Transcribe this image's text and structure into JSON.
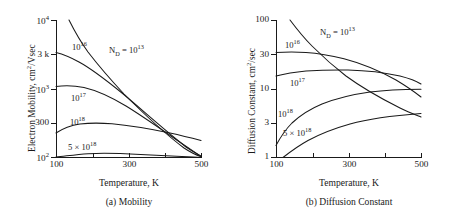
{
  "figure": {
    "background": "#ffffff",
    "line_color": "#1a1a1a"
  },
  "chart_data": [
    {
      "type": "line",
      "panel_id": "a",
      "title": "",
      "caption": "(a) Mobility",
      "xlabel": "Temperature, K",
      "ylabel": "Electron Mobility, cm2/Vsec",
      "ylabel_html": "Electron Mobility, cm<sup>2</sup>/Vsec",
      "xscale": "linear",
      "yscale": "log",
      "xlim": [
        100,
        500
      ],
      "ylim": [
        100,
        10000
      ],
      "grid": false,
      "legend_position": "inline-curve-labels",
      "xticks": [
        100,
        200,
        300,
        400,
        500
      ],
      "xtick_labels": [
        "100",
        "",
        "300",
        "",
        "500"
      ],
      "yticks": [
        100,
        300,
        1000,
        3000,
        10000
      ],
      "ytick_labels": [
        "10^2",
        "300",
        "10^3",
        "3 k",
        "10^4"
      ],
      "ytick_labels_html": [
        "10<sup>2</sup>",
        "300",
        "10<sup>3</sup>",
        "3 k",
        "10<sup>4</sup>"
      ],
      "x": [
        100,
        125,
        150,
        175,
        200,
        250,
        300,
        350,
        400,
        450,
        500
      ],
      "series": [
        {
          "name": "N_D = 10^13",
          "label": "N<sub>D</sub> = 10<sup>13</sup>",
          "values": [
            null,
            10000,
            6400,
            4600,
            3500,
            2300,
            1600,
            1150,
            820,
            580,
            320
          ]
        },
        {
          "name": "10^16",
          "label": "10<sup>16</sup>",
          "values": [
            3200,
            3050,
            2800,
            2500,
            2200,
            1700,
            1350,
            1020,
            760,
            560,
            330
          ]
        },
        {
          "name": "10^17",
          "label": "10<sup>17</sup>",
          "values": [
            1550,
            1580,
            1570,
            1530,
            1470,
            1300,
            1110,
            900,
            700,
            520,
            310
          ]
        },
        {
          "name": "10^18",
          "label": "10<sup>18</sup>",
          "values": [
            235,
            265,
            288,
            298,
            302,
            300,
            293,
            285,
            275,
            264,
            250
          ]
        },
        {
          "name": "5 x 10^18",
          "label": "5 &#215; 10<sup>18</sup>",
          "values": [
            101,
            106,
            111,
            115,
            117,
            116,
            113,
            110,
            107,
            104,
            101
          ]
        }
      ]
    },
    {
      "type": "line",
      "panel_id": "b",
      "title": "",
      "caption": "(b) Diffusion Constant",
      "xlabel": "Temperature, K",
      "ylabel": "Diffusion Constant, cm2/sec",
      "ylabel_html": "Diffusion Constant, cm<sup>2</sup>/sec",
      "xscale": "linear",
      "yscale": "log",
      "xlim": [
        100,
        500
      ],
      "ylim": [
        1,
        100
      ],
      "grid": false,
      "legend_position": "inline-curve-labels",
      "xticks": [
        100,
        200,
        300,
        400,
        500
      ],
      "xtick_labels": [
        "100",
        "",
        "300",
        "",
        "500"
      ],
      "yticks": [
        1,
        3,
        10,
        30,
        100
      ],
      "ytick_labels": [
        "1",
        "3",
        "10",
        "30",
        "100"
      ],
      "x": [
        100,
        125,
        150,
        175,
        200,
        250,
        300,
        350,
        400,
        450,
        500
      ],
      "series": [
        {
          "name": "N_D = 10^13",
          "label": "N<sub>D</sub> = 10<sup>13</sup>",
          "values": [
            null,
            100,
            72,
            58,
            48,
            37,
            29,
            24,
            21,
            19,
            17.5
          ]
        },
        {
          "name": "10^16",
          "label": "10<sup>16</sup>",
          "values": [
            33,
            33.5,
            33.5,
            33,
            32,
            30,
            28,
            25,
            22.5,
            20,
            17.8
          ]
        },
        {
          "name": "10^17",
          "label": "10<sup>17</sup>",
          "values": [
            17,
            18,
            19,
            19.5,
            20,
            20.5,
            20.5,
            20.2,
            19.5,
            18,
            16.2
          ]
        },
        {
          "name": "10^18",
          "label": "10<sup>18</sup>",
          "values": [
            2.0,
            3.3,
            4.5,
            5.4,
            6.1,
            7.2,
            8.0,
            8.6,
            8.9,
            9.0,
            9.0
          ]
        },
        {
          "name": "5 x 10^18",
          "label": "5 &#215; 10<sup>18</sup>",
          "values": [
            null,
            1.0,
            1.35,
            1.65,
            1.9,
            2.35,
            2.75,
            3.05,
            3.3,
            3.5,
            3.7
          ]
        }
      ]
    }
  ]
}
